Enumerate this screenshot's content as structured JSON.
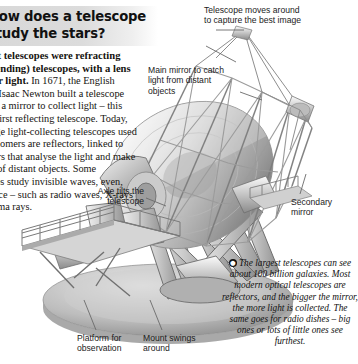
{
  "page": {
    "background": "#ffffff",
    "heading_band_color": "#d8d8d8"
  },
  "heading": {
    "title": "How does a telescope study the stars?"
  },
  "body": {
    "intro_bold": "The first telescopes were refracting (light-bending) telescopes, with a lens to gather light.",
    "paragraph": " In 1671, the English scientist Isaac Newton built a telescope that used a mirror to collect light – this was the first reflecting telescope. Today, most large light-collecting telescopes used by astronomers are reflectors, linked to computers that analyse the light and make pictures of distant objects. Some telescopes study invisible waves, even, from space – such as radio waves, X-rays and gamma rays.",
    "visible_fragment_lines": [
      "copes were refracting",
      "ding) telescopes, with a lens",
      "ight. In 1671, the English",
      "Isaac Newton built a telescope",
      "mirror to collect light – this was",
      "ecting",
      "oday, most",
      "t-collecting)",
      "sed by",
      "s are",
      "nked",
      "rs",
      "e",
      "of",
      "cts.",
      "scopes",
      "se, even",
      "radio",
      "nd"
    ]
  },
  "callouts": [
    {
      "id": "telescope-moves",
      "text": "Telescope moves around\nto capture the best image"
    },
    {
      "id": "main-mirror",
      "text": "Main mirror to catch\nlight from distant\nobjects"
    },
    {
      "id": "secondary-mirror",
      "text": "Secondary\nmirror"
    },
    {
      "id": "axle-tilts",
      "text": "Axle tilts the\ntelescope"
    },
    {
      "id": "platform",
      "text": "Platform for\nobservation"
    },
    {
      "id": "mount-swings",
      "text": "Mount swings\naround"
    }
  ],
  "fact_box": {
    "bullet_icon": "info-bullet",
    "text": "The largest telescopes can see about 100 billion galaxies. Most modern optical telescopes are reflectors, and the bigger the mirror, the more light is collected. The same goes for radio dishes – big ones or lots of little ones see furthest."
  },
  "illustration": {
    "name": "telescope-cutaway-illustration",
    "description": "Grey-scale 3-D rendering of a large reflecting telescope on an alt-azimuth mount with open truss tube, observation platform, circular rotating base"
  }
}
